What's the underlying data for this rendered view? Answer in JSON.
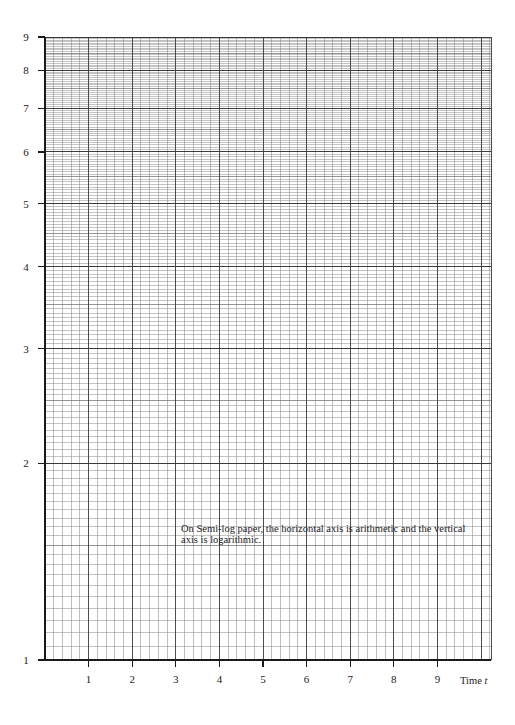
{
  "chart_data": {
    "type": "line",
    "title": "",
    "subtitle": "Semi-log graph paper",
    "xlabel": "Time t",
    "ylabel": "",
    "x_scale": "linear",
    "y_scale": "log",
    "xlim": [
      0,
      10
    ],
    "ylim": [
      1,
      9
    ],
    "x_ticks": [
      1,
      2,
      3,
      4,
      5,
      6,
      7,
      8,
      9
    ],
    "x_tick_labels": [
      "1",
      "2",
      "3",
      "4",
      "5",
      "6",
      "7",
      "8",
      "9"
    ],
    "y_ticks": [
      1,
      2,
      3,
      4,
      5,
      6,
      7,
      8,
      9
    ],
    "y_tick_labels": [
      "1",
      "2",
      "3",
      "4",
      "5",
      "6",
      "7",
      "8",
      "9"
    ],
    "x_minor_per_unit": 5,
    "y_minor_step": 0.05,
    "grid": true,
    "series": [],
    "annotations": [
      "On Semi-log paper, the horizontal axis is arithmetic and the vertical axis is logarithmic."
    ]
  },
  "axis": {
    "x_title": "Time t"
  },
  "note": {
    "text": "On Semi-log paper, the horizontal axis is arithmetic and the vertical axis is logarithmic."
  },
  "style": {
    "grid_color": "#8a8a8a",
    "major_color": "#3a3a3a",
    "axis_color": "#1a1a1a"
  }
}
